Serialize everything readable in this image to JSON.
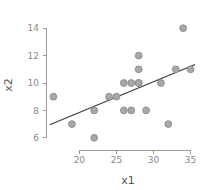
{
  "chart_data": {
    "type": "scatter",
    "title": "",
    "subtitle": "",
    "xlabel": "x1",
    "ylabel": "x2",
    "xlim": [
      15.5,
      36.0
    ],
    "ylim": [
      5.4,
      14.6
    ],
    "xticks": [
      20,
      25,
      30,
      35
    ],
    "xtick_labels": [
      "20",
      "25",
      "30",
      "35"
    ],
    "yticks": [
      6,
      8,
      10,
      12,
      14
    ],
    "ytick_labels": [
      "6",
      "8",
      "10",
      "12",
      "14"
    ],
    "grid": false,
    "legend": null,
    "legend_position": "none",
    "marker": {
      "shape": "circle",
      "fill_color": "#a8a8a8",
      "edge_color": "#8a8a8a",
      "radius_px": 3.4
    },
    "axis_color": "#999999",
    "tick_label_color": "#888888",
    "axis_title_color": "#555555",
    "series": [
      {
        "name": "observations",
        "x": [
          16.5,
          19.0,
          22.0,
          22.0,
          24.0,
          25.0,
          26.0,
          26.0,
          27.0,
          27.0,
          28.0,
          28.0,
          28.0,
          28.0,
          29.0,
          31.0,
          32.0,
          33.0,
          34.0,
          35.0
        ],
        "y": [
          9.0,
          7.0,
          6.0,
          8.0,
          9.0,
          9.0,
          8.0,
          10.0,
          8.0,
          10.0,
          10.0,
          10.0,
          11.0,
          12.0,
          8.0,
          10.0,
          7.0,
          11.0,
          14.0,
          11.0
        ]
      }
    ],
    "fit_line": {
      "name": "regression-line",
      "color": "#3a3a3a",
      "x_start": 16.0,
      "y_start": 6.95,
      "x_end": 35.6,
      "y_end": 11.35
    }
  }
}
